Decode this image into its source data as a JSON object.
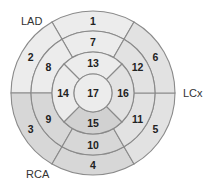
{
  "diagram": {
    "type": "17-segment bull's-eye plot",
    "center": [
      93,
      93
    ],
    "radii": {
      "basal": 82,
      "mid": 62,
      "apical": 41,
      "apex": 19
    },
    "stroke_color": "#8a8a8a",
    "territory_colors": {
      "LAD": "#ececec",
      "LCx": "#e2e2e2",
      "RCA": "#d7d7d7",
      "RCA_apical": "#d1d1d1"
    },
    "artery_labels": {
      "lad": "LAD",
      "lcx": "LCx",
      "rca": "RCA"
    },
    "segments": [
      {
        "id": "1",
        "ring": "basal",
        "territory": "LAD",
        "start_deg": 60,
        "end_deg": 120
      },
      {
        "id": "2",
        "ring": "basal",
        "territory": "LAD",
        "start_deg": 120,
        "end_deg": 180
      },
      {
        "id": "3",
        "ring": "basal",
        "territory": "RCA",
        "start_deg": 180,
        "end_deg": 240
      },
      {
        "id": "4",
        "ring": "basal",
        "territory": "RCA",
        "start_deg": 240,
        "end_deg": 300
      },
      {
        "id": "5",
        "ring": "basal",
        "territory": "LCx",
        "start_deg": 300,
        "end_deg": 360
      },
      {
        "id": "6",
        "ring": "basal",
        "territory": "LCx",
        "start_deg": 0,
        "end_deg": 60
      },
      {
        "id": "7",
        "ring": "mid",
        "territory": "LAD",
        "start_deg": 60,
        "end_deg": 120
      },
      {
        "id": "8",
        "ring": "mid",
        "territory": "LAD",
        "start_deg": 120,
        "end_deg": 180
      },
      {
        "id": "9",
        "ring": "mid",
        "territory": "RCA",
        "start_deg": 180,
        "end_deg": 240
      },
      {
        "id": "10",
        "ring": "mid",
        "territory": "RCA",
        "start_deg": 240,
        "end_deg": 300
      },
      {
        "id": "11",
        "ring": "mid",
        "territory": "LCx",
        "start_deg": 300,
        "end_deg": 360
      },
      {
        "id": "12",
        "ring": "mid",
        "territory": "LCx",
        "start_deg": 0,
        "end_deg": 60
      },
      {
        "id": "13",
        "ring": "apical",
        "territory": "LAD",
        "start_deg": 45,
        "end_deg": 135
      },
      {
        "id": "14",
        "ring": "apical",
        "territory": "LAD",
        "start_deg": 135,
        "end_deg": 225
      },
      {
        "id": "15",
        "ring": "apical",
        "territory": "RCA_apical",
        "start_deg": 225,
        "end_deg": 315
      },
      {
        "id": "16",
        "ring": "apical",
        "territory": "LCx",
        "start_deg": 315,
        "end_deg": 405
      },
      {
        "id": "17",
        "ring": "apex",
        "territory": "LAD",
        "start_deg": 0,
        "end_deg": 360
      }
    ]
  }
}
